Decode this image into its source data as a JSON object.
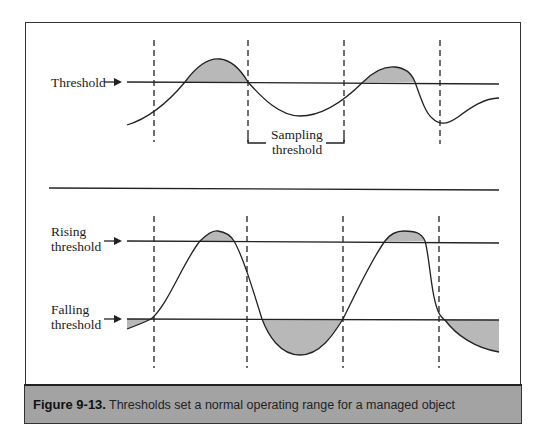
{
  "figure": {
    "number": "Figure 9-13.",
    "caption": "Thresholds set a normal operating range for a managed object"
  },
  "top_panel": {
    "threshold_label": "Threshold",
    "bracket_label_line1": "Sampling",
    "bracket_label_line2": "threshold"
  },
  "bottom_panel": {
    "rising_label_line1": "Rising",
    "rising_label_line2": "threshold",
    "falling_label_line1": "Falling",
    "falling_label_line2": "threshold"
  },
  "colors": {
    "fill": "#b8b8b8",
    "line": "#222222",
    "caption_bg": "#a3a3a3"
  }
}
